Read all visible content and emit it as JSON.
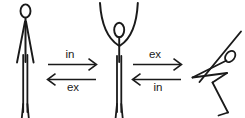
{
  "diagram": {
    "type": "state-transition-diagram",
    "background_color": "#ffffff",
    "stroke_color": "#1a1a1a",
    "width": 245,
    "height": 118,
    "states": [
      {
        "id": "state-standing",
        "name": "standing-figure-arms-down",
        "description": "Stick figure standing upright with arms hanging down at the sides",
        "position": "left"
      },
      {
        "id": "state-arms-up",
        "name": "standing-figure-arms-raised",
        "description": "Stick figure standing upright with both arms raised overhead in a curved U shape",
        "position": "center"
      },
      {
        "id": "state-forward-fold",
        "name": "forward-fold-figure",
        "description": "Stick figure bent forward at the hips with arms reaching down toward the feet",
        "position": "right"
      }
    ],
    "transitions": [
      {
        "id": "transition-1-forward",
        "label": "in",
        "from": "state-standing",
        "to": "state-arms-up",
        "direction": "right",
        "label_position": "above"
      },
      {
        "id": "transition-1-backward",
        "label": "ex",
        "from": "state-arms-up",
        "to": "state-standing",
        "direction": "left",
        "label_position": "below"
      },
      {
        "id": "transition-2-forward",
        "label": "ex",
        "from": "state-arms-up",
        "to": "state-forward-fold",
        "direction": "right",
        "label_position": "above"
      },
      {
        "id": "transition-2-backward",
        "label": "in",
        "from": "state-forward-fold",
        "to": "state-arms-up",
        "direction": "left",
        "label_position": "below"
      }
    ]
  }
}
